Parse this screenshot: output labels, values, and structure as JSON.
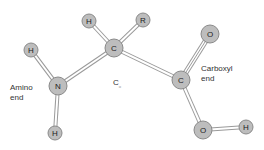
{
  "diagram": {
    "type": "molecular-structure",
    "atoms": [
      {
        "id": "h1",
        "label": "H",
        "x": 31,
        "y": 50,
        "r": 7
      },
      {
        "id": "n",
        "label": "N",
        "x": 58,
        "y": 86,
        "r": 9
      },
      {
        "id": "h2",
        "label": "H",
        "x": 55,
        "y": 133,
        "r": 7
      },
      {
        "id": "h3",
        "label": "H",
        "x": 89,
        "y": 21,
        "r": 7
      },
      {
        "id": "ca",
        "label": "C",
        "x": 114,
        "y": 48,
        "r": 9
      },
      {
        "id": "r",
        "label": "R",
        "x": 143,
        "y": 20,
        "r": 7
      },
      {
        "id": "c",
        "label": "C",
        "x": 181,
        "y": 80,
        "r": 9
      },
      {
        "id": "o1",
        "label": "O",
        "x": 210,
        "y": 34,
        "r": 9
      },
      {
        "id": "o2",
        "label": "O",
        "x": 203,
        "y": 130,
        "r": 9
      },
      {
        "id": "h4",
        "label": "H",
        "x": 246,
        "y": 127,
        "r": 7
      }
    ],
    "bonds": [
      {
        "from": "h1",
        "to": "n",
        "order": 1
      },
      {
        "from": "n",
        "to": "h2",
        "order": 1
      },
      {
        "from": "n",
        "to": "ca",
        "order": 1
      },
      {
        "from": "h3",
        "to": "ca",
        "order": 1
      },
      {
        "from": "ca",
        "to": "r",
        "order": 1
      },
      {
        "from": "ca",
        "to": "c",
        "order": 1
      },
      {
        "from": "c",
        "to": "o1",
        "order": 2
      },
      {
        "from": "c",
        "to": "o2",
        "order": 1
      },
      {
        "from": "o2",
        "to": "h4",
        "order": 1
      }
    ],
    "labels": {
      "amino": "Amino\nend",
      "carboxyl": "Carboxyl\nend",
      "calpha_main": "C",
      "calpha_sub": "α"
    }
  }
}
